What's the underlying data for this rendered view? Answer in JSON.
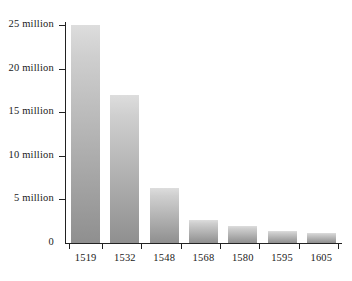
{
  "chart_data": {
    "type": "bar",
    "title": "",
    "subtitle": "",
    "xlabel": "",
    "ylabel": "",
    "categories": [
      "1519",
      "1532",
      "1548",
      "1568",
      "1580",
      "1595",
      "1605"
    ],
    "values": [
      25000000,
      17000000,
      6300000,
      2600000,
      2000000,
      1400000,
      1200000
    ],
    "series": [
      {
        "name": "Population",
        "values": [
          25000000,
          17000000,
          6300000,
          2600000,
          2000000,
          1400000,
          1200000
        ]
      }
    ],
    "ylim": [
      0,
      26000000
    ],
    "y_ticks": [
      0,
      5000000,
      10000000,
      15000000,
      20000000,
      25000000
    ],
    "y_tick_labels": [
      "0",
      "5 million",
      "10 million",
      "15 million",
      "20 million",
      "25 million"
    ],
    "x_tick_labels": [
      "1519",
      "1532",
      "1548",
      "1568",
      "1580",
      "1595",
      "1605"
    ],
    "grid": false,
    "legend": null,
    "legend_position": "none",
    "annotations": [],
    "bar_color_top": "#dddddd",
    "bar_color_bottom": "#8f8f8f",
    "axis_color": "#222222",
    "background_color": "#ffffff"
  }
}
